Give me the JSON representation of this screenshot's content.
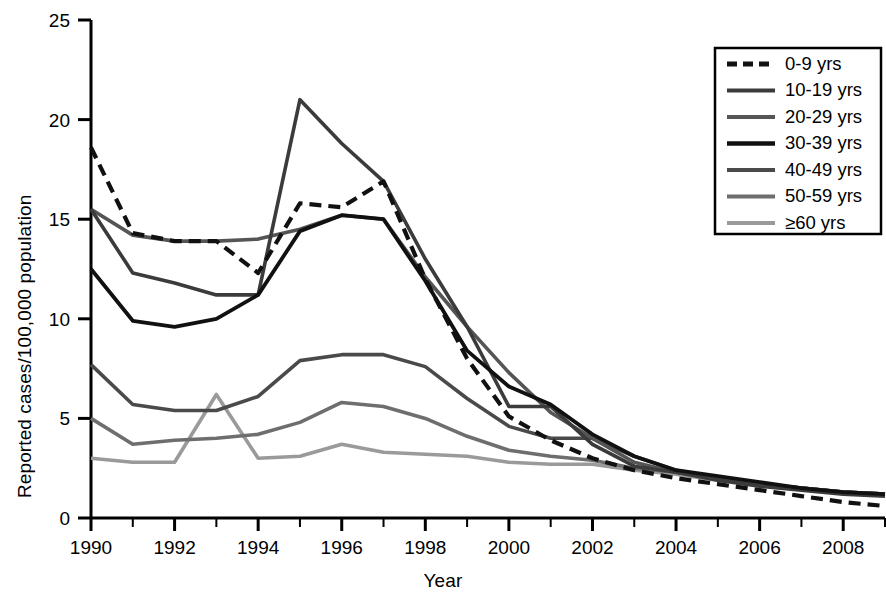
{
  "chart_data": {
    "type": "line",
    "title": "",
    "xlabel": "Year",
    "ylabel": "Reported cases/100,000 population",
    "x": [
      1990,
      1991,
      1992,
      1993,
      1994,
      1995,
      1996,
      1997,
      1998,
      1999,
      2000,
      2001,
      2002,
      2003,
      2004,
      2005,
      2006,
      2007,
      2008,
      2009
    ],
    "xlim": [
      1990,
      2009
    ],
    "ylim": [
      0,
      25
    ],
    "xticks": [
      1990,
      1992,
      1994,
      1996,
      1998,
      2000,
      2002,
      2004,
      2006,
      2008
    ],
    "xtick_labels": [
      "1990",
      "1992",
      "1994",
      "1996",
      "1998",
      "2000",
      "2002",
      "2004",
      "2006",
      "2008"
    ],
    "yticks": [
      0,
      5,
      10,
      15,
      20,
      25
    ],
    "ytick_labels": [
      "0",
      "5",
      "10",
      "15",
      "20",
      "25"
    ],
    "grid": false,
    "legend_position": "top-right",
    "series": [
      {
        "name": "0-9 yrs",
        "color": "#111111",
        "dash": "12,7",
        "width": 4.2,
        "values": [
          18.6,
          14.3,
          13.9,
          13.9,
          12.3,
          15.8,
          15.6,
          16.9,
          12.0,
          8.0,
          5.1,
          3.9,
          3.0,
          2.4,
          2.0,
          1.7,
          1.4,
          1.1,
          0.8,
          0.6
        ]
      },
      {
        "name": "10-19 yrs",
        "color": "#3b3b3b",
        "dash": "",
        "width": 3.6,
        "values": [
          15.5,
          12.3,
          11.8,
          11.2,
          11.2,
          21.0,
          18.8,
          16.9,
          13.0,
          9.6,
          5.6,
          5.6,
          3.7,
          2.6,
          2.3,
          1.9,
          1.6,
          1.4,
          1.2,
          1.1
        ]
      },
      {
        "name": "20-29 yrs",
        "color": "#555555",
        "dash": "",
        "width": 3.6,
        "values": [
          15.5,
          14.2,
          13.9,
          13.9,
          14.0,
          14.5,
          15.2,
          15.0,
          12.1,
          9.6,
          7.3,
          5.3,
          4.0,
          2.8,
          2.3,
          2.0,
          1.7,
          1.5,
          1.3,
          1.2
        ]
      },
      {
        "name": "30-39 yrs",
        "color": "#111111",
        "dash": "",
        "width": 3.8,
        "values": [
          12.5,
          9.9,
          9.6,
          10.0,
          11.2,
          14.4,
          15.2,
          15.0,
          11.9,
          8.4,
          6.6,
          5.7,
          4.2,
          3.1,
          2.4,
          2.1,
          1.8,
          1.5,
          1.3,
          1.2
        ]
      },
      {
        "name": "40-49 yrs",
        "color": "#4a4a4a",
        "dash": "",
        "width": 3.6,
        "values": [
          7.7,
          5.7,
          5.4,
          5.4,
          6.1,
          7.9,
          8.2,
          8.2,
          7.6,
          6.0,
          4.6,
          4.0,
          4.0,
          3.1,
          2.4,
          2.0,
          1.7,
          1.5,
          1.3,
          1.2
        ]
      },
      {
        "name": "50-59 yrs",
        "color": "#6e6e6e",
        "dash": "",
        "width": 3.6,
        "values": [
          5.0,
          3.7,
          3.9,
          4.0,
          4.2,
          4.8,
          5.8,
          5.6,
          5.0,
          4.1,
          3.4,
          3.1,
          2.9,
          2.5,
          2.3,
          2.0,
          1.7,
          1.5,
          1.3,
          1.2
        ]
      },
      {
        "name": "≥60 yrs",
        "color": "#9a9a9a",
        "dash": "",
        "width": 3.6,
        "values": [
          3.0,
          2.8,
          2.8,
          6.2,
          3.0,
          3.1,
          3.7,
          3.3,
          3.2,
          3.1,
          2.8,
          2.7,
          2.7,
          2.4,
          2.2,
          1.9,
          1.7,
          1.5,
          1.3,
          1.2
        ]
      }
    ]
  },
  "legend": {
    "items": [
      {
        "label": "0-9 yrs"
      },
      {
        "label": "10-19 yrs"
      },
      {
        "label": "20-29 yrs"
      },
      {
        "label": "30-39 yrs"
      },
      {
        "label": "40-49 yrs"
      },
      {
        "label": "50-59 yrs"
      },
      {
        "label": "≥60 yrs"
      }
    ]
  }
}
